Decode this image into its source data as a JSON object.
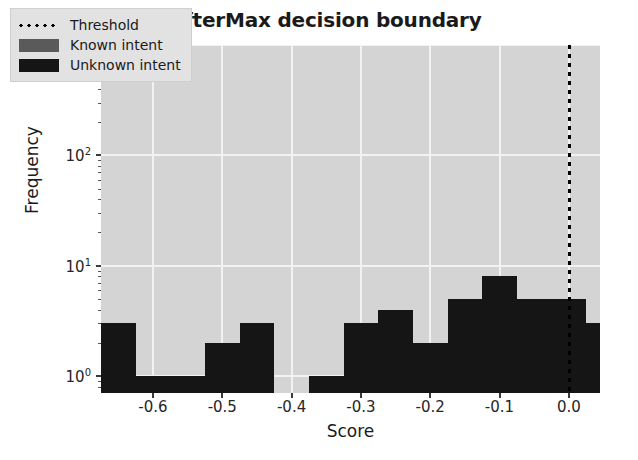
{
  "chart_data": {
    "type": "bar",
    "title": "SofterMax decision boundary",
    "xlabel": "Score",
    "ylabel": "Frequency",
    "yscale": "log",
    "ylim": [
      0.7,
      1000
    ],
    "xlim": [
      -0.675,
      0.045
    ],
    "grid": true,
    "xticks": [
      -0.6,
      -0.5,
      -0.4,
      -0.3,
      -0.2,
      -0.1,
      0.0
    ],
    "xtick_labels": [
      "-0.6",
      "-0.5",
      "-0.4",
      "-0.3",
      "-0.2",
      "-0.1",
      "0.0"
    ],
    "yticks": [
      1,
      10,
      100,
      1000
    ],
    "ytick_labels": [
      "10",
      "10",
      "10",
      "10"
    ],
    "ytick_exponents": [
      "0",
      "1",
      "2",
      "3"
    ],
    "legend_position": "upper left",
    "legend": [
      {
        "label": "Threshold",
        "style": "dotted-line",
        "color": "#000000"
      },
      {
        "label": "Known intent",
        "style": "patch",
        "color": "#5a5a5a"
      },
      {
        "label": "Unknown intent",
        "style": "patch",
        "color": "#151515"
      }
    ],
    "annotations": [
      {
        "name": "threshold-line",
        "type": "vline",
        "x": 0.0,
        "label": "Threshold"
      }
    ],
    "bin_width": 0.05,
    "series": [
      {
        "name": "Unknown intent",
        "color": "#151515",
        "bins": [
          {
            "x0": -0.655,
            "x1": -0.605,
            "value": 3
          },
          {
            "x0": -0.605,
            "x1": -0.555,
            "value": 1
          },
          {
            "x0": -0.555,
            "x1": -0.505,
            "value": 1
          },
          {
            "x0": -0.505,
            "x1": -0.455,
            "value": 2
          },
          {
            "x0": -0.455,
            "x1": -0.405,
            "value": 3
          },
          {
            "x0": -0.405,
            "x1": -0.355,
            "value": 0
          },
          {
            "x0": -0.355,
            "x1": -0.305,
            "value": 1
          },
          {
            "x0": -0.305,
            "x1": -0.255,
            "value": 3
          },
          {
            "x0": -0.255,
            "x1": -0.205,
            "value": 4
          },
          {
            "x0": -0.205,
            "x1": -0.155,
            "value": 2
          },
          {
            "x0": -0.155,
            "x1": -0.105,
            "value": 5
          },
          {
            "x0": -0.105,
            "x1": -0.055,
            "value": 8
          },
          {
            "x0": -0.055,
            "x1": -0.005,
            "value": 5
          },
          {
            "x0": -0.005,
            "x1": 0.045,
            "value": 5
          },
          {
            "x0": 0.045,
            "x1": 0.095,
            "value": 3
          },
          {
            "x0": 0.095,
            "x1": 0.145,
            "value": 5
          },
          {
            "x0": 0.145,
            "x1": 0.195,
            "value": 12
          },
          {
            "x0": 0.195,
            "x1": 0.245,
            "value": 6
          },
          {
            "x0": 0.245,
            "x1": 0.295,
            "value": 50
          }
        ]
      },
      {
        "name": "Known intent",
        "color": "#5a5a5a",
        "bins": [
          {
            "x0": 0.295,
            "x1": 0.335,
            "value": 700
          }
        ]
      }
    ]
  }
}
